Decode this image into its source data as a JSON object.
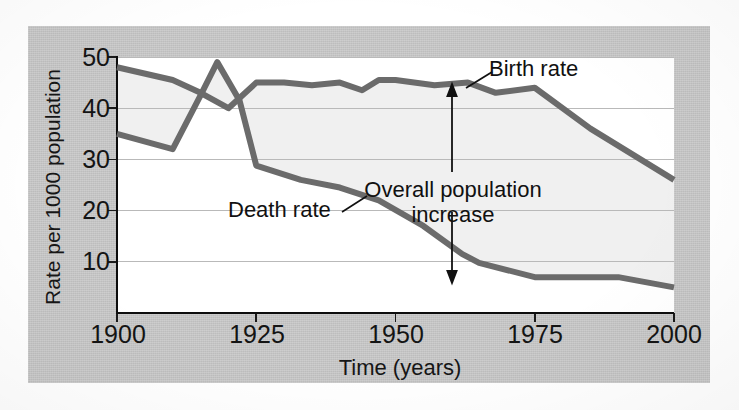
{
  "chart_data": {
    "type": "line",
    "title": "",
    "subtitle": "",
    "xlabel": "Time (years)",
    "ylabel": "Rate per 1000 population",
    "xlim": [
      1900,
      2000
    ],
    "ylim": [
      0,
      50
    ],
    "xticks": [
      "1900",
      "1925",
      "1950",
      "1975",
      "2000"
    ],
    "xtick_values": [
      1900,
      1925,
      1950,
      1975,
      2000
    ],
    "yticks": [
      "10",
      "20",
      "30",
      "40",
      "50"
    ],
    "ytick_values": [
      10,
      20,
      30,
      40,
      50
    ],
    "grid": "horizontal",
    "legend_position": "inline-labels",
    "series": [
      {
        "name": "Birth rate",
        "color": "#6b6b6b",
        "x": [
          1900,
          1910,
          1915,
          1920,
          1925,
          1930,
          1935,
          1940,
          1944,
          1947,
          1950,
          1957,
          1963,
          1968,
          1975,
          1985,
          2000
        ],
        "values": [
          48,
          45.5,
          43,
          40,
          45,
          45,
          44.5,
          45,
          43.5,
          45.5,
          45.5,
          44.5,
          45,
          43,
          44,
          36,
          26
        ]
      },
      {
        "name": "Death rate",
        "color": "#6b6b6b",
        "x": [
          1900,
          1910,
          1915,
          1918,
          1922,
          1925,
          1933,
          1940,
          1947,
          1955,
          1962,
          1965,
          1975,
          1990,
          2000
        ],
        "values": [
          35,
          32,
          42.5,
          49,
          41.5,
          28.8,
          26,
          24.5,
          22,
          17,
          11.5,
          9.8,
          7,
          7,
          5
        ]
      }
    ],
    "annotations": [
      {
        "text": "Birth rate",
        "kind": "series-label-with-leader"
      },
      {
        "text": "Death rate",
        "kind": "series-label-with-leader"
      },
      {
        "text": "Overall population increase",
        "kind": "double-arrow-gap-label"
      }
    ],
    "shaded_region": {
      "label": "Overall population increase",
      "between": [
        "Birth rate",
        "Death rate"
      ],
      "color": "#f0f0f0"
    }
  },
  "axes": {
    "y_label": "Rate per 1000 population",
    "x_label": "Time (years)",
    "y_ticks": [
      "50",
      "40",
      "30",
      "20",
      "10"
    ],
    "x_ticks": [
      "1900",
      "1925",
      "1950",
      "1975",
      "2000"
    ]
  },
  "annotations": {
    "birth_rate": "Birth rate",
    "death_rate": "Death rate",
    "overall_line1": "Overall population",
    "overall_line2": "increase"
  },
  "colors": {
    "card_background": "#c9c9c9",
    "plot_background": "#ffffff",
    "line": "#6b6b6b",
    "axis": "#0d0d0d",
    "gridline": "#b9b9b9",
    "shaded_gap": "#f0f0f0",
    "text": "#141414"
  }
}
